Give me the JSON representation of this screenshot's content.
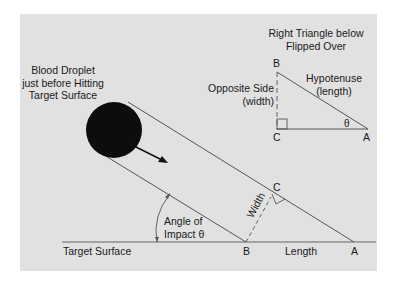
{
  "diagram": {
    "droplet_label": [
      "Blood Droplet",
      "just before Hitting",
      "Target Surface"
    ],
    "inset_title": [
      "Right Triangle below",
      "Flipped Over"
    ],
    "inset": {
      "vertex_b": "B",
      "vertex_c": "C",
      "vertex_a": "A",
      "opposite_label": [
        "Opposite Side",
        "(width)"
      ],
      "hypotenuse_label": [
        "Hypotenuse",
        "(length)"
      ],
      "angle_symbol": "θ"
    },
    "main": {
      "angle_label": [
        "Angle of",
        "Impact θ"
      ],
      "width_label": "Width",
      "length_label": "Length",
      "surface_label": "Target Surface",
      "vertex_b": "B",
      "vertex_c": "C",
      "vertex_a": "A"
    },
    "colors": {
      "panel_bg": "#e1e1e1",
      "line": "#555555",
      "droplet": "#0d0d0d",
      "text": "#1a1a1a"
    }
  }
}
